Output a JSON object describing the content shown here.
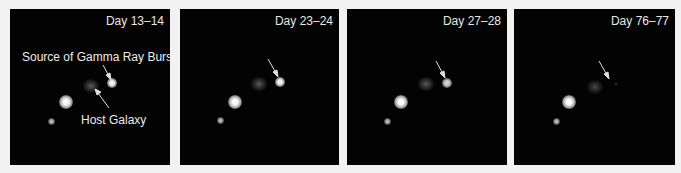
{
  "figure": {
    "panels": [
      {
        "label": "Day 13–14",
        "grb_visible": "bright"
      },
      {
        "label": "Day 23–24",
        "grb_visible": "bright"
      },
      {
        "label": "Day 27–28",
        "grb_visible": "moderate"
      },
      {
        "label": "Day 76–77",
        "grb_visible": "faded"
      }
    ],
    "annotations": {
      "grb_source": "Source of Gamma Ray Burst",
      "host_galaxy": "Host Galaxy"
    },
    "colors": {
      "background": "#f2f2f2",
      "panel": "#030303",
      "text": "#ececec"
    }
  }
}
